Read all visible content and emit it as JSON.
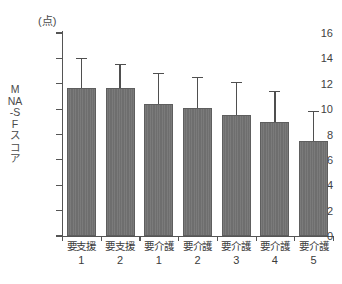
{
  "chart_data": {
    "type": "bar",
    "title": "",
    "subtitle": "",
    "unit_label": "(点)",
    "ylabel": "MNA-SFスコア",
    "xlabel": "",
    "ylim": [
      0,
      16
    ],
    "ytick_labels": [
      "0",
      "2",
      "4",
      "6",
      "8",
      "10",
      "12",
      "14",
      "16"
    ],
    "ytick_values": [
      0,
      2,
      4,
      6,
      8,
      10,
      12,
      14,
      16
    ],
    "grid": false,
    "legend": null,
    "categories": [
      "要支援1",
      "要支援2",
      "要介護1",
      "要介護2",
      "要介護3",
      "要介護4",
      "要介護5"
    ],
    "category_names": [
      "要支援",
      "要支援",
      "要介護",
      "要介護",
      "要介護",
      "要介護",
      "要介護"
    ],
    "category_numbers": [
      "1",
      "2",
      "1",
      "2",
      "3",
      "4",
      "5"
    ],
    "values": [
      11.7,
      11.7,
      10.4,
      10.1,
      9.5,
      9.0,
      7.5
    ],
    "error_upper": [
      14.0,
      13.5,
      12.8,
      12.5,
      12.1,
      11.4,
      9.8
    ],
    "error_bars": "upper-only",
    "bar_color": "#6e6e6e",
    "axis_color": "#555555",
    "text_color": "#3f3f3f",
    "background_color": "#ffffff"
  }
}
